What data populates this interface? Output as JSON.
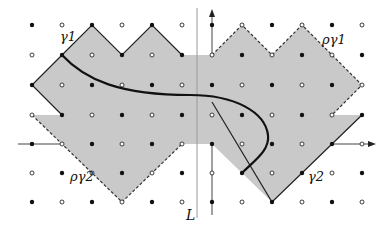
{
  "figure": {
    "colors": {
      "region_fill": "#c9c9c9",
      "curve": "#111111",
      "edge": "#222222",
      "axis": "#444444",
      "line_L": "#9a9a9a"
    },
    "labels": {
      "gamma1": "γ1",
      "rho_gamma1": "ργ1",
      "gamma2": "γ2",
      "rho_gamma2": "ργ2",
      "line_L": "L"
    },
    "grid": {
      "columns_x": [
        32,
        62,
        92,
        122,
        152,
        182,
        212,
        242,
        272,
        302,
        332,
        362
      ],
      "rows_y": [
        25,
        55,
        85,
        115,
        144,
        173,
        202
      ],
      "dot_pattern": "alternating filled/hollow by parity"
    }
  }
}
